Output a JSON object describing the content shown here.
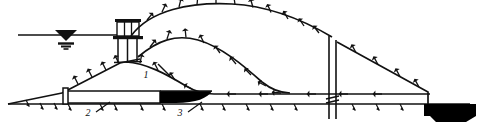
{
  "figure": {
    "domain": "engineering-cross-section",
    "background_color": "#ffffff",
    "line_color": "#111111",
    "fill_black": "#000000",
    "fill_white": "#ffffff",
    "width": 490,
    "height": 130
  },
  "labels": [
    {
      "id": "callout-1",
      "text": "1",
      "x": 146,
      "y": 78,
      "note": "embankment slope / dam body"
    },
    {
      "id": "callout-2",
      "text": "2",
      "x": 88,
      "y": 116,
      "note": "drainage blanket (white band)"
    },
    {
      "id": "callout-3",
      "text": "3",
      "x": 180,
      "y": 116,
      "note": "filter / core wedge (black band)"
    }
  ],
  "elements": {
    "water_level_symbol": "water-surface-triangle",
    "intake_tower": "intake-tower",
    "break_line": "section-break-line",
    "outlet_block": "outlet-block",
    "ground_hatching": "ground-hatch-ticks",
    "slope_hatching": "slope-hatch-ticks"
  }
}
